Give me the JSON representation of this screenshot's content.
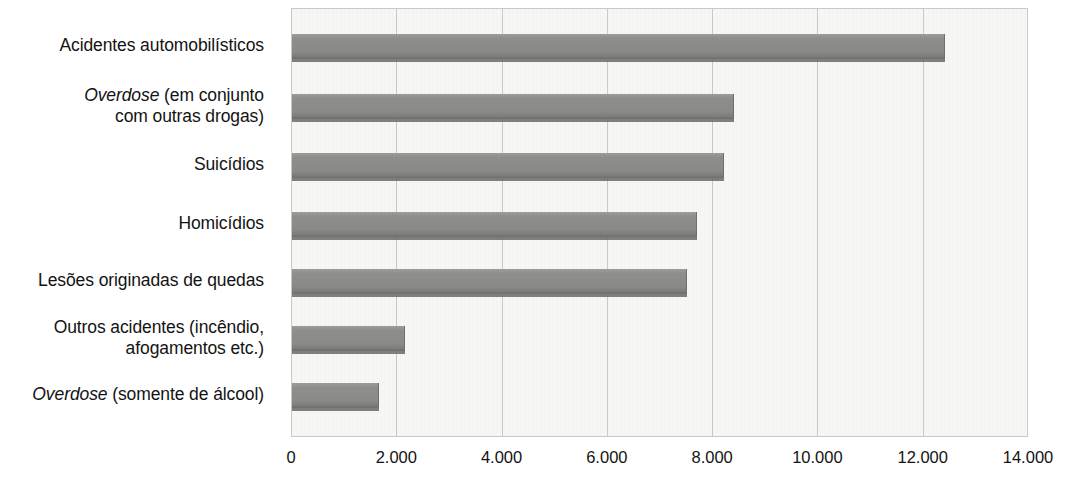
{
  "chart_data": {
    "type": "bar",
    "orientation": "horizontal",
    "title": "",
    "subtitle": "",
    "xlabel": "",
    "ylabel": "",
    "xlim": [
      0,
      14000
    ],
    "grid": true,
    "legend": null,
    "categories": [
      "Acidentes automobilísticos",
      "Overdose (em conjunto com outras drogas)",
      "Suicídios",
      "Homicídios",
      "Lesões originadas de quedas",
      "Outros acidentes (incêndio, afogamentos etc.)",
      "Overdose (somente de álcool)"
    ],
    "values": [
      12400,
      8400,
      8200,
      7700,
      7500,
      2150,
      1650
    ],
    "xticks": [
      0,
      2000,
      4000,
      6000,
      8000,
      10000,
      12000,
      14000
    ],
    "xtick_labels": [
      "0",
      "2.000",
      "4.000",
      "6.000",
      "8.000",
      "10.000",
      "12.000",
      "14.000"
    ],
    "colors": {
      "bar": "#8a8a88",
      "bar_edge": "#6a6a68",
      "plot_background": "#f6f6f4",
      "gridline": "#c9c9c7",
      "text": "#131313"
    }
  },
  "category_labels": [
    {
      "id": "acidentes-automobilisticos",
      "lines": [
        {
          "text": "Acidentes automobilísticos",
          "italic": false
        }
      ]
    },
    {
      "id": "overdose-com-outras-drogas",
      "lines": [
        {
          "text": "Overdose",
          "italic": true
        },
        {
          "text": " (em conjunto",
          "italic": false
        },
        {
          "text": "\n",
          "italic": false
        },
        {
          "text": "com outras drogas)",
          "italic": false
        }
      ]
    },
    {
      "id": "suicidios",
      "lines": [
        {
          "text": "Suicídios",
          "italic": false
        }
      ]
    },
    {
      "id": "homicidios",
      "lines": [
        {
          "text": "Homicídios",
          "italic": false
        }
      ]
    },
    {
      "id": "lesoes-de-quedas",
      "lines": [
        {
          "text": "Lesões originadas de quedas",
          "italic": false
        }
      ]
    },
    {
      "id": "outros-acidentes",
      "lines": [
        {
          "text": "Outros acidentes (incêndio,",
          "italic": false
        },
        {
          "text": "\n",
          "italic": false
        },
        {
          "text": "afogamentos etc.)",
          "italic": false
        }
      ]
    },
    {
      "id": "overdose-somente-alcool",
      "lines": [
        {
          "text": "Overdose",
          "italic": true
        },
        {
          "text": " (somente de álcool)",
          "italic": false
        }
      ]
    }
  ]
}
